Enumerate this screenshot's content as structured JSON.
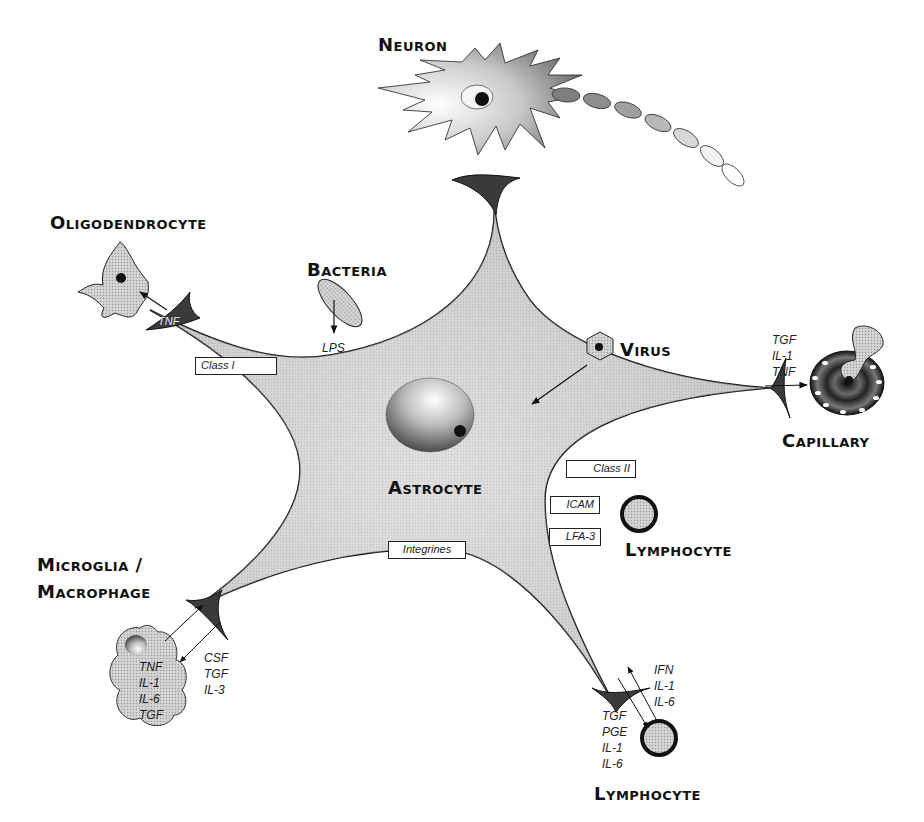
{
  "diagram": {
    "central_cell": {
      "label": "Astrocyte"
    },
    "cells": {
      "neuron": {
        "label": "Neuron"
      },
      "oligodendrocyte": {
        "label": "Oligodendrocyte"
      },
      "bacteria": {
        "label": "Bacteria"
      },
      "virus": {
        "label": "Virus"
      },
      "capillary": {
        "label": "Capillary"
      },
      "lymphocyte_mid": {
        "label": "Lymphocyte"
      },
      "microglia": {
        "label_line1": "Microglia /",
        "label_line2": "Macrophage"
      },
      "lymphocyte_bottom": {
        "label": "Lymphocyte"
      }
    },
    "receptors": {
      "class_i": "Class I",
      "class_ii": "Class II",
      "icam": "ICAM",
      "lfa3": "LFA-3",
      "integrines": "Integrines"
    },
    "cytokines": {
      "oligodendrocyte_end": "TNF",
      "bacteria_product": "LPS",
      "capillary": [
        "TGF",
        "IL-1",
        "TNF"
      ],
      "microglia_to_astro": [
        "TNF",
        "IL-1",
        "IL-6",
        "TGF"
      ],
      "astro_to_microglia": [
        "CSF",
        "TGF",
        "IL-3"
      ],
      "lymph_to_astro": [
        "IFN",
        "IL-1",
        "IL-6"
      ],
      "astro_to_lymph": [
        "TGF",
        "PGE",
        "IL-1",
        "IL-6"
      ]
    },
    "colors": {
      "body_fill": "#c8c8c8",
      "endfoot_fill": "#3a3a3a",
      "outline": "#111111",
      "background": "#ffffff"
    }
  }
}
